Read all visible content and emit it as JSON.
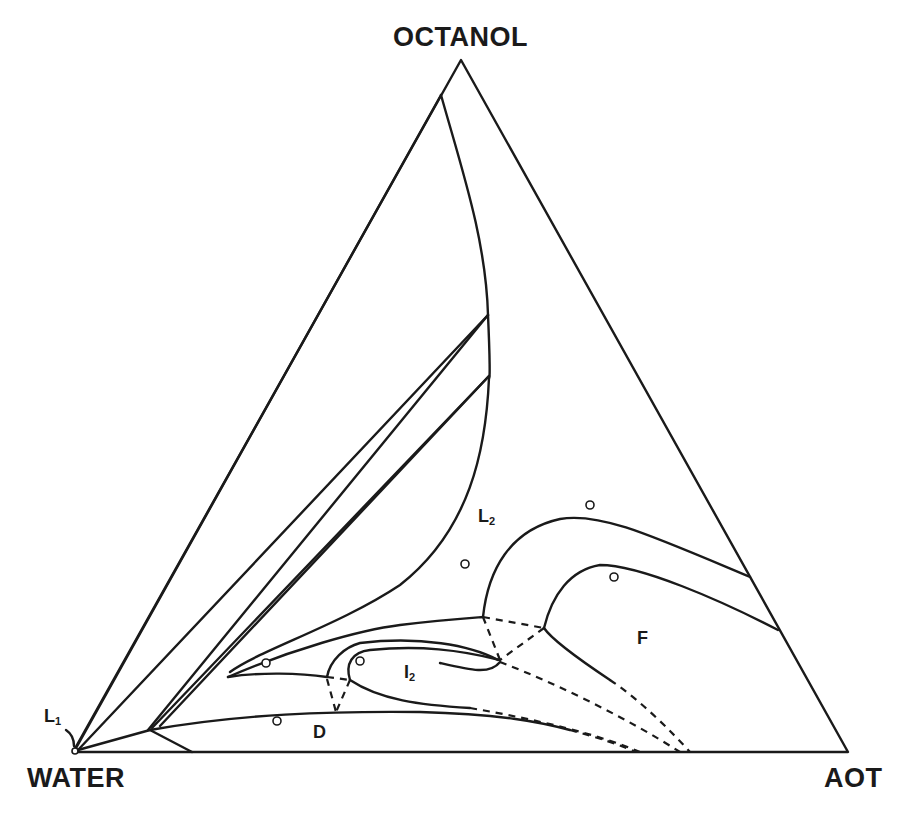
{
  "diagram": {
    "type": "ternary phase diagram",
    "vertices": {
      "top": "OCTANOL",
      "bottom_left": "WATER",
      "bottom_right": "AOT"
    },
    "regions": [
      {
        "id": "L1",
        "main": "L",
        "sub": "1"
      },
      {
        "id": "L2",
        "main": "L",
        "sub": "2"
      },
      {
        "id": "I2",
        "main": "I",
        "sub": "2"
      },
      {
        "id": "D",
        "main": "D",
        "sub": ""
      },
      {
        "id": "F",
        "main": "F",
        "sub": ""
      }
    ],
    "sample_points_count": 7,
    "line_color": "#1a1a1a",
    "background": "#ffffff"
  }
}
